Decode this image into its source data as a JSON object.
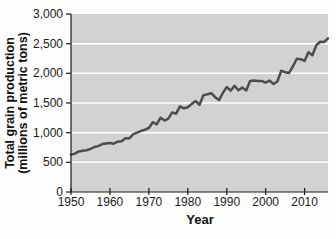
{
  "chart_data": {
    "type": "line",
    "title": "",
    "xlabel": "Year",
    "ylabel": "Total grain production (millions of metric tons)",
    "ylabel_lines": [
      "Total grain production",
      "(millions of metric tons)"
    ],
    "xlim": [
      1950,
      2016
    ],
    "ylim": [
      0,
      3000
    ],
    "grid": "horizontal",
    "legend": "none",
    "x_ticks": {
      "values": [
        1950,
        1960,
        1970,
        1980,
        1990,
        2000,
        2010
      ],
      "labels": [
        "1950",
        "1960",
        "1970",
        "1980",
        "1990",
        "2000",
        "2010"
      ]
    },
    "y_ticks": {
      "values": [
        0,
        500,
        1000,
        1500,
        2000,
        2500,
        3000
      ],
      "labels": [
        "0",
        "500",
        "1,000",
        "1,500",
        "2,000",
        "2,500",
        "3,000"
      ]
    },
    "series": [
      {
        "name": "Total grain production",
        "x": [
          1950,
          1951,
          1952,
          1953,
          1954,
          1955,
          1956,
          1957,
          1958,
          1959,
          1960,
          1961,
          1962,
          1963,
          1964,
          1965,
          1966,
          1967,
          1968,
          1969,
          1970,
          1971,
          1972,
          1973,
          1974,
          1975,
          1976,
          1977,
          1978,
          1979,
          1980,
          1981,
          1982,
          1983,
          1984,
          1985,
          1986,
          1987,
          1988,
          1989,
          1990,
          1991,
          1992,
          1993,
          1994,
          1995,
          1996,
          1997,
          1998,
          1999,
          2000,
          2001,
          2002,
          2003,
          2004,
          2005,
          2006,
          2007,
          2008,
          2009,
          2010,
          2011,
          2012,
          2013,
          2014,
          2015,
          2016
        ],
        "values": [
          631,
          645,
          684,
          696,
          704,
          727,
          759,
          773,
          807,
          815,
          824,
          814,
          848,
          857,
          907,
          905,
          975,
          1000,
          1030,
          1050,
          1079,
          1177,
          1141,
          1253,
          1204,
          1237,
          1342,
          1319,
          1445,
          1411,
          1430,
          1482,
          1533,
          1469,
          1632,
          1647,
          1665,
          1598,
          1549,
          1671,
          1769,
          1708,
          1790,
          1714,
          1760,
          1713,
          1871,
          1880,
          1872,
          1871,
          1843,
          1877,
          1821,
          1863,
          2044,
          2017,
          2005,
          2121,
          2246,
          2238,
          2210,
          2356,
          2306,
          2474,
          2533,
          2528,
          2591
        ]
      }
    ],
    "colors": {
      "line": "#4d4d4d",
      "plot_background": "#d2d2d2",
      "gridline": "#ffffff",
      "axis": "#1a1a1a",
      "text": "#1a1a1a"
    }
  }
}
